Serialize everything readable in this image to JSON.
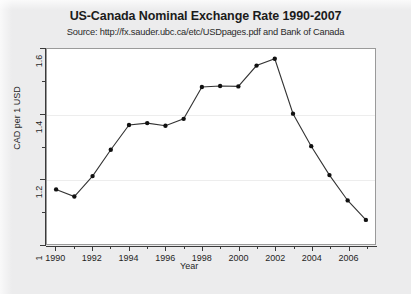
{
  "chart_data": {
    "type": "line",
    "title": "US-Canada Nominal Exchange Rate 1990-2007",
    "subtitle": "Source: http://fx.sauder.ubc.ca/etc/USDpages.pdf and Bank of Canada",
    "xlabel": "Year",
    "ylabel": "CAD per 1 USD",
    "xlim": [
      1989.5,
      2007.5
    ],
    "ylim": [
      1.0,
      1.6
    ],
    "yticks": [
      1,
      1.2,
      1.4,
      1.6
    ],
    "ytick_labels": [
      "1",
      "1.2",
      "1.4",
      "1.6"
    ],
    "yticks_minor": [
      1.1,
      1.3,
      1.5
    ],
    "xticks": [
      1990,
      1992,
      1994,
      1996,
      1998,
      2000,
      2002,
      2004,
      2006
    ],
    "xtick_labels": [
      "1990",
      "1992",
      "1994",
      "1996",
      "1998",
      "2000",
      "2002",
      "2004",
      "2006"
    ],
    "xticks_minor": [
      1991,
      1993,
      1995,
      1997,
      1999,
      2001,
      2003,
      2005,
      2007
    ],
    "grid": true,
    "legend": false,
    "marker": "filled-circle",
    "line_color": "#333333",
    "marker_color": "#111111",
    "panel_color": "#ffffff",
    "page_color": "#ececed",
    "x": [
      1990,
      1991,
      1992,
      1993,
      1994,
      1995,
      1996,
      1997,
      1998,
      1999,
      2000,
      2001,
      2002,
      2003,
      2004,
      2005,
      2006,
      2007
    ],
    "values": [
      1.168,
      1.146,
      1.209,
      1.29,
      1.366,
      1.372,
      1.364,
      1.385,
      1.483,
      1.486,
      1.485,
      1.549,
      1.57,
      1.401,
      1.301,
      1.212,
      1.134,
      1.074
    ],
    "series": [
      {
        "name": "CAD per 1 USD",
        "values": [
          1.168,
          1.146,
          1.209,
          1.29,
          1.366,
          1.372,
          1.364,
          1.385,
          1.483,
          1.486,
          1.485,
          1.549,
          1.57,
          1.401,
          1.301,
          1.212,
          1.134,
          1.074
        ]
      }
    ]
  }
}
